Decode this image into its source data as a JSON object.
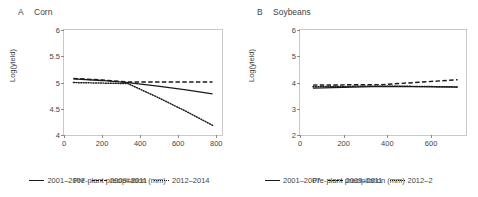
{
  "figure": {
    "panels": [
      {
        "letter": "A",
        "title": "Corn",
        "ylabel": "Log(yield)",
        "xlabel": "Pre-plant precipitation (mm)",
        "yticks": [
          "4",
          "4.5",
          "5",
          "5.5",
          "6"
        ],
        "xticks": [
          "0",
          "200",
          "400",
          "600",
          "800"
        ],
        "legend": [
          {
            "label": "2001–2007",
            "style": "solid"
          },
          {
            "label": "2009–2011",
            "style": "dashed"
          },
          {
            "label": "2012–2014",
            "style": "dotted"
          }
        ]
      },
      {
        "letter": "B",
        "title": "Soybeans",
        "ylabel": "Log(yield)",
        "xlabel": "Pre-plant precipitation (mm)",
        "yticks": [
          "2",
          "3",
          "4",
          "5",
          "6"
        ],
        "xticks": [
          "0",
          "200",
          "400",
          "600"
        ],
        "legend": [
          {
            "label": "2001–2007",
            "style": "solid"
          },
          {
            "label": "2009–2011",
            "style": "dashed"
          },
          {
            "label": "2012–2",
            "style": "dotted"
          }
        ]
      }
    ]
  },
  "chart_data": [
    {
      "type": "line",
      "title": "Corn",
      "panel_letter": "A",
      "xlabel": "Pre-plant precipitation (mm)",
      "ylabel": "Log(yield)",
      "xlim": [
        0,
        830
      ],
      "ylim": [
        4,
        6
      ],
      "xticks": [
        0,
        200,
        400,
        600,
        800
      ],
      "yticks": [
        4,
        4.5,
        5,
        5.5,
        6
      ],
      "grid": false,
      "legend_position": "below",
      "series": [
        {
          "name": "2001–2007",
          "style": "solid",
          "x": [
            50,
            200,
            340,
            500,
            650,
            790
          ],
          "y": [
            5.05,
            5.02,
            4.98,
            4.91,
            4.84,
            4.76
          ]
        },
        {
          "name": "2009–2011",
          "style": "dashed",
          "x": [
            50,
            200,
            340,
            500,
            650,
            790
          ],
          "y": [
            5.06,
            5.03,
            4.99,
            4.99,
            4.99,
            4.99
          ]
        },
        {
          "name": "2012–2014",
          "style": "dotted",
          "x": [
            50,
            200,
            340,
            500,
            650,
            790
          ],
          "y": [
            4.98,
            4.97,
            4.96,
            4.69,
            4.42,
            4.15
          ]
        }
      ]
    },
    {
      "type": "line",
      "title": "Soybeans",
      "panel_letter": "B",
      "xlabel": "Pre-plant precipitation (mm)",
      "ylabel": "Log(yield)",
      "xlim": [
        0,
        760
      ],
      "ylim": [
        2,
        6
      ],
      "xticks": [
        0,
        200,
        400,
        600
      ],
      "yticks": [
        2,
        3,
        4,
        5,
        6
      ],
      "grid": false,
      "legend_position": "below",
      "series": [
        {
          "name": "2001–2007",
          "style": "solid",
          "x": [
            60,
            200,
            380,
            550,
            730
          ],
          "y": [
            3.74,
            3.77,
            3.81,
            3.8,
            3.78
          ]
        },
        {
          "name": "2009–2011",
          "style": "dashed",
          "x": [
            60,
            200,
            380,
            550,
            730
          ],
          "y": [
            3.86,
            3.87,
            3.88,
            3.97,
            4.07
          ]
        },
        {
          "name": "2012–2014",
          "style": "dotted",
          "x": [
            60,
            200,
            380,
            550,
            730
          ],
          "y": [
            3.8,
            3.81,
            3.82,
            3.81,
            3.79
          ]
        }
      ]
    }
  ]
}
